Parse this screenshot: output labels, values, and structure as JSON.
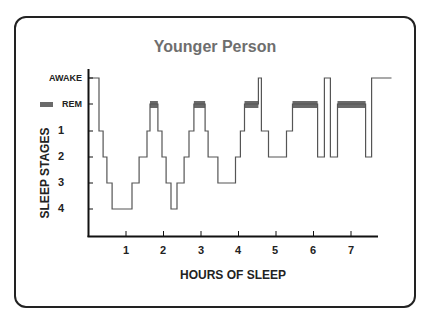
{
  "chart_data": {
    "type": "line",
    "subtype": "step (hypnogram)",
    "title": "Younger Person",
    "xlabel": "HOURS OF SLEEP",
    "ylabel": "SLEEP STAGES",
    "x_ticks": [
      1,
      2,
      3,
      4,
      5,
      6,
      7
    ],
    "xlim": [
      0,
      7.8
    ],
    "y_categories": [
      "AWAKE",
      "REM",
      "1",
      "2",
      "3",
      "4"
    ],
    "legend": [
      {
        "label": "REM",
        "color": "#6a6a6a"
      }
    ],
    "grid": false,
    "series": [
      {
        "name": "Sleep stage",
        "steps": [
          {
            "start": 0.0,
            "end": 0.28,
            "stage": "AWAKE"
          },
          {
            "start": 0.28,
            "end": 0.39,
            "stage": "1"
          },
          {
            "start": 0.39,
            "end": 0.49,
            "stage": "2"
          },
          {
            "start": 0.49,
            "end": 0.63,
            "stage": "3"
          },
          {
            "start": 0.63,
            "end": 1.16,
            "stage": "4"
          },
          {
            "start": 1.16,
            "end": 1.35,
            "stage": "3"
          },
          {
            "start": 1.35,
            "end": 1.56,
            "stage": "2"
          },
          {
            "start": 1.56,
            "end": 1.64,
            "stage": "1"
          },
          {
            "start": 1.64,
            "end": 1.85,
            "stage": "REM"
          },
          {
            "start": 1.85,
            "end": 1.96,
            "stage": "1"
          },
          {
            "start": 1.96,
            "end": 2.07,
            "stage": "2"
          },
          {
            "start": 2.07,
            "end": 2.2,
            "stage": "3"
          },
          {
            "start": 2.2,
            "end": 2.36,
            "stage": "4"
          },
          {
            "start": 2.36,
            "end": 2.55,
            "stage": "3"
          },
          {
            "start": 2.55,
            "end": 2.68,
            "stage": "2"
          },
          {
            "start": 2.68,
            "end": 2.81,
            "stage": "1"
          },
          {
            "start": 2.81,
            "end": 3.11,
            "stage": "REM"
          },
          {
            "start": 3.11,
            "end": 3.19,
            "stage": "1"
          },
          {
            "start": 3.19,
            "end": 3.45,
            "stage": "2"
          },
          {
            "start": 3.45,
            "end": 3.92,
            "stage": "3"
          },
          {
            "start": 3.92,
            "end": 4.05,
            "stage": "2"
          },
          {
            "start": 4.05,
            "end": 4.16,
            "stage": "1"
          },
          {
            "start": 4.16,
            "end": 4.53,
            "stage": "REM"
          },
          {
            "start": 4.53,
            "end": 4.61,
            "stage": "AWAKE"
          },
          {
            "start": 4.61,
            "end": 4.8,
            "stage": "1"
          },
          {
            "start": 4.8,
            "end": 5.28,
            "stage": "2"
          },
          {
            "start": 5.28,
            "end": 5.44,
            "stage": "1"
          },
          {
            "start": 5.44,
            "end": 6.11,
            "stage": "REM"
          },
          {
            "start": 6.11,
            "end": 6.29,
            "stage": "2"
          },
          {
            "start": 6.29,
            "end": 6.45,
            "stage": "AWAKE"
          },
          {
            "start": 6.45,
            "end": 6.64,
            "stage": "2"
          },
          {
            "start": 6.64,
            "end": 7.39,
            "stage": "REM"
          },
          {
            "start": 7.39,
            "end": 7.55,
            "stage": "2"
          },
          {
            "start": 7.55,
            "end": 8.08,
            "stage": "AWAKE"
          }
        ]
      }
    ]
  },
  "labels": {
    "title": "Younger Person",
    "y_title": "SLEEP STAGES",
    "x_title": "HOURS OF SLEEP",
    "y_ticks": [
      "AWAKE",
      "REM",
      "1",
      "2",
      "3",
      "4"
    ],
    "x_ticks": [
      "1",
      "2",
      "3",
      "4",
      "5",
      "6",
      "7"
    ]
  }
}
